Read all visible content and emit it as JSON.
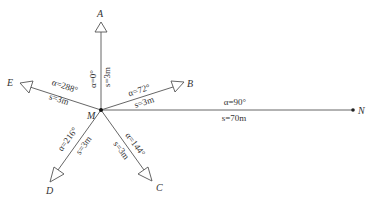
{
  "diagram": {
    "type": "survey-radial-sketch",
    "center": {
      "label": "M"
    },
    "colors": {
      "line": "#555555",
      "text": "#333333",
      "background": "#ffffff"
    },
    "rays": [
      {
        "point": "A",
        "alpha": "α=0°",
        "distance": "s=3m"
      },
      {
        "point": "B",
        "alpha": "α=72°",
        "distance": "s=3m"
      },
      {
        "point": "C",
        "alpha": "α=144°",
        "distance": "s=3m"
      },
      {
        "point": "D",
        "alpha": "α=216°",
        "distance": "s=3m"
      },
      {
        "point": "E",
        "alpha": "α=288°",
        "distance": "s=3m"
      },
      {
        "point": "N",
        "alpha": "α=90°",
        "distance": "s=70m"
      }
    ]
  }
}
